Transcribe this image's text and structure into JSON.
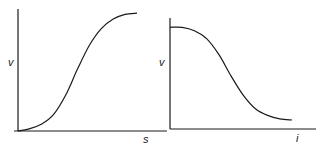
{
  "chart_data": [
    {
      "type": "line",
      "title": "",
      "xlabel": "s",
      "ylabel": "v",
      "shape": "sigmoid-increasing",
      "x": [
        0,
        0.1,
        0.2,
        0.3,
        0.4,
        0.5,
        0.6,
        0.7,
        0.8,
        0.9,
        1.0
      ],
      "values": [
        0.0,
        0.02,
        0.06,
        0.14,
        0.3,
        0.52,
        0.72,
        0.86,
        0.94,
        0.98,
        0.99
      ],
      "xlim": [
        0,
        1.2
      ],
      "ylim": [
        0,
        1.0
      ],
      "grid": false,
      "ticks": false
    },
    {
      "type": "line",
      "title": "",
      "xlabel": "i",
      "ylabel": "v",
      "shape": "sigmoid-decreasing",
      "x": [
        0,
        0.1,
        0.2,
        0.3,
        0.4,
        0.5,
        0.6,
        0.7,
        0.8,
        0.9,
        1.0
      ],
      "values": [
        0.9,
        0.9,
        0.87,
        0.8,
        0.66,
        0.47,
        0.3,
        0.18,
        0.12,
        0.09,
        0.08
      ],
      "xlim": [
        0,
        1.2
      ],
      "ylim": [
        0,
        1.0
      ],
      "grid": false,
      "ticks": false
    }
  ]
}
